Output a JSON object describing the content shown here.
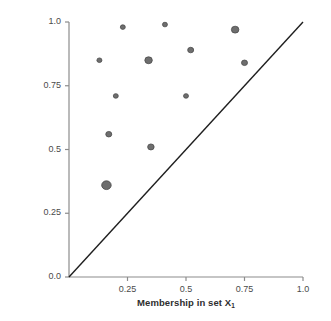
{
  "chart_data": {
    "type": "scatter",
    "title": "",
    "xlabel": "Membership in set X",
    "xlabel_sub": "1",
    "ylabel": "Membership in set Y",
    "xlim": [
      0.0,
      1.0
    ],
    "ylim": [
      0.0,
      1.0
    ],
    "grid": false,
    "legend": "none",
    "xticks": [
      "0.25",
      "0.5",
      "0.75",
      "1.0"
    ],
    "xtick_values": [
      0.25,
      0.5,
      0.75,
      1.0
    ],
    "yticks": [
      "0.0",
      "0.25",
      "0.5",
      "0.75",
      "1.0"
    ],
    "ytick_values": [
      0.0,
      0.25,
      0.5,
      0.75,
      1.0
    ],
    "marker_color": "#6e6e6e",
    "marker_edge_color": "#4a4a4a",
    "line_color": "#1f1f1f",
    "axis_color": "#8c8c8c",
    "reference_line": {
      "name": "diagonal-y-equals-x",
      "from": [
        0.0,
        0.0
      ],
      "to": [
        1.0,
        1.0
      ]
    },
    "points": [
      {
        "x": 0.13,
        "y": 0.85,
        "size": 5.0
      },
      {
        "x": 0.23,
        "y": 0.98,
        "size": 5.0
      },
      {
        "x": 0.2,
        "y": 0.71,
        "size": 5.0
      },
      {
        "x": 0.17,
        "y": 0.56,
        "size": 6.0
      },
      {
        "x": 0.16,
        "y": 0.36,
        "size": 9.5
      },
      {
        "x": 0.34,
        "y": 0.85,
        "size": 7.5
      },
      {
        "x": 0.35,
        "y": 0.51,
        "size": 6.5
      },
      {
        "x": 0.41,
        "y": 0.99,
        "size": 5.0
      },
      {
        "x": 0.5,
        "y": 0.71,
        "size": 5.0
      },
      {
        "x": 0.52,
        "y": 0.89,
        "size": 6.0
      },
      {
        "x": 0.71,
        "y": 0.97,
        "size": 7.5
      },
      {
        "x": 0.75,
        "y": 0.84,
        "size": 6.0
      }
    ]
  }
}
